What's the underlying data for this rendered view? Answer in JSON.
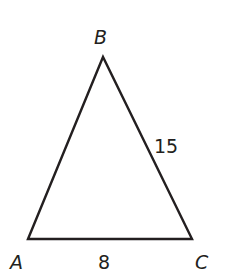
{
  "diagram": {
    "type": "triangle",
    "vertices": [
      {
        "label": "A",
        "x": 28,
        "y": 239
      },
      {
        "label": "B",
        "x": 103,
        "y": 57
      },
      {
        "label": "C",
        "x": 192,
        "y": 239
      }
    ],
    "sides": [
      {
        "between": "AC",
        "length_label": "8"
      },
      {
        "between": "BC",
        "length_label": "15"
      }
    ],
    "stroke_color": "#231f20"
  }
}
